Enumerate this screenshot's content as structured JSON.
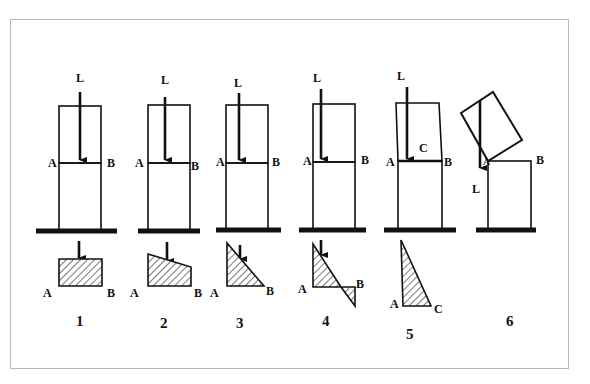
{
  "figure": {
    "load_label": "L",
    "panels": [
      {
        "number": "1",
        "labels": {
          "left": "A",
          "right": "B"
        },
        "stress_shape": "rectangle",
        "load_position": "center"
      },
      {
        "number": "2",
        "labels": {
          "left": "A",
          "right": "B"
        },
        "stress_shape": "trapezoid",
        "load_position": "off-center"
      },
      {
        "number": "3",
        "labels": {
          "left": "A",
          "right": "B"
        },
        "stress_shape": "triangle",
        "load_position": "middle-third edge"
      },
      {
        "number": "4",
        "labels": {
          "left": "A",
          "right": "B"
        },
        "stress_shape": "triangle with tension reversal",
        "load_position": "outside middle third"
      },
      {
        "number": "5",
        "labels": {
          "left": "A",
          "right": "B",
          "crack": "C",
          "stress_right": "C"
        },
        "stress_shape": "narrow triangle",
        "load_position": "near edge A, crack opening"
      },
      {
        "number": "6",
        "labels": {
          "left": "A",
          "right": "B",
          "load_below": "L"
        },
        "stress_shape": "none",
        "load_position": "outside base, block overturning"
      }
    ]
  }
}
